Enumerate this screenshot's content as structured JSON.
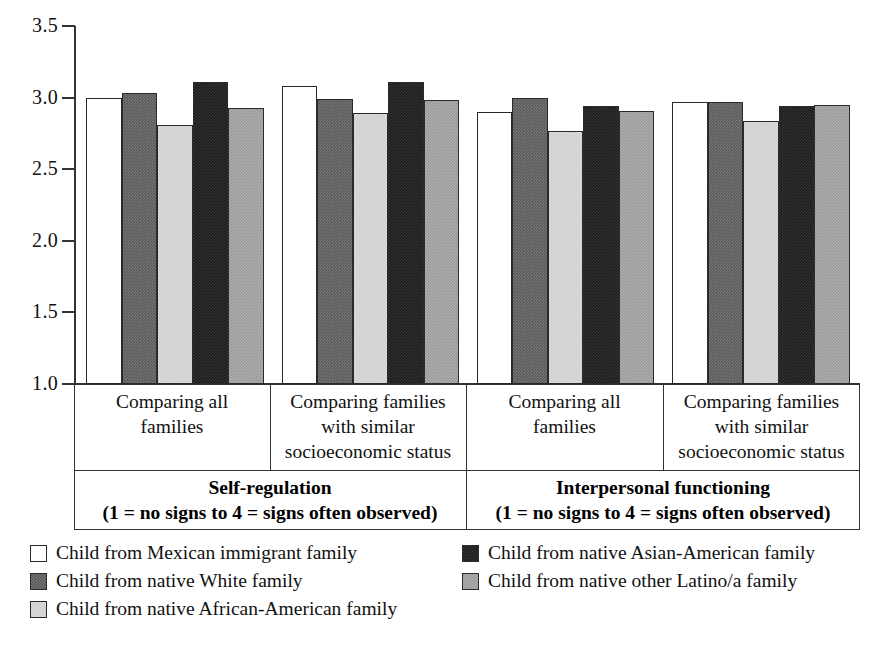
{
  "chart_data": {
    "type": "bar",
    "title": "",
    "subtitle": "",
    "xlabel": "",
    "ylabel": "",
    "ylim": [
      1.0,
      3.5
    ],
    "ytick_labels": [
      "3.5",
      "3.0",
      "2.5",
      "2.0",
      "1.5",
      "1.0"
    ],
    "ytick_values": [
      3.5,
      3.0,
      2.5,
      2.0,
      1.5,
      1.0
    ],
    "grid": false,
    "legend_position": "bottom",
    "panels": [
      {
        "id": "self-regulation",
        "title": "Self-regulation",
        "subtitle": "(1 = no signs to 4 = signs often observed)",
        "groups": [
          {
            "label": "Comparing all families",
            "label_lines": [
              "Comparing all",
              "families"
            ],
            "values": [
              3.0,
              3.03,
              2.81,
              3.11,
              2.93
            ]
          },
          {
            "label": "Comparing families with similar socioeconomic status",
            "label_lines": [
              "Comparing families",
              "with similar",
              "socioeconomic status"
            ],
            "values": [
              3.08,
              2.99,
              2.89,
              3.11,
              2.98
            ]
          }
        ]
      },
      {
        "id": "interpersonal-functioning",
        "title": "Interpersonal functioning",
        "subtitle": "(1 = no signs to 4 = signs often observed)",
        "groups": [
          {
            "label": "Comparing all families",
            "label_lines": [
              "Comparing all",
              "families"
            ],
            "values": [
              2.9,
              3.0,
              2.77,
              2.94,
              2.91
            ]
          },
          {
            "label": "Comparing families with similar socioeconomic status",
            "label_lines": [
              "Comparing families",
              "with similar",
              "socioeconomic status"
            ],
            "values": [
              2.97,
              2.97,
              2.84,
              2.94,
              2.95
            ]
          }
        ]
      }
    ],
    "series": [
      {
        "name": "Child from Mexican immigrant family",
        "swatch": "white",
        "color": "#ffffff"
      },
      {
        "name": "Child from native White family",
        "swatch": "darkgray",
        "color": "#5a5a5a"
      },
      {
        "name": "Child from native African-American family",
        "swatch": "lightgray",
        "color": "#dcdcdc"
      },
      {
        "name": "Child from native Asian-American family",
        "swatch": "black",
        "color": "#1c1c1c"
      },
      {
        "name": "Child from native other Latino/a family",
        "swatch": "midgray",
        "color": "#9a9a9a"
      }
    ]
  },
  "legend": {
    "left_column": [
      "Child from Mexican immigrant family",
      "Child from native White family",
      "Child from native African-American family"
    ],
    "right_column": [
      "Child from native Asian-American family",
      "Child from native other Latino/a family"
    ]
  }
}
